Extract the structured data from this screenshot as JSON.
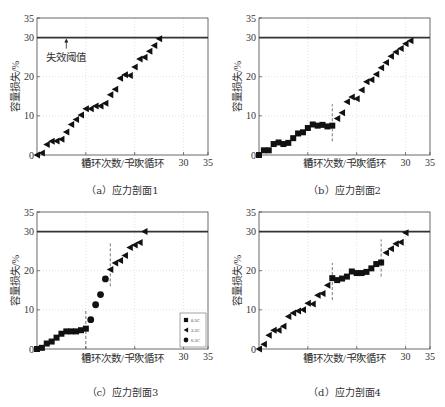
{
  "figure": {
    "panels": [
      {
        "id": "a",
        "caption": "（a）应力剖面1"
      },
      {
        "id": "b",
        "caption": "（b）应力剖面2"
      },
      {
        "id": "c",
        "caption": "（c）应力剖面3"
      },
      {
        "id": "d",
        "caption": "（d）应力剖面4"
      }
    ]
  },
  "chart_data": [
    {
      "type": "scatter",
      "title": "（a）应力剖面1",
      "xlabel": "循环次数/千次循环",
      "ylabel": "容量损失/%",
      "xlim": [
        0,
        35
      ],
      "ylim": [
        0,
        35
      ],
      "xticks": [
        10,
        20,
        30,
        35
      ],
      "yticks": [
        0,
        10,
        20,
        30,
        35
      ],
      "grid": true,
      "threshold": {
        "y": 30,
        "label": "失效阈值",
        "arrow_x": 6
      },
      "dividers": [],
      "series": [
        {
          "name": "3.5C",
          "marker": "triangle-left",
          "x": [
            0,
            1,
            2,
            3,
            4,
            5,
            6,
            7,
            8,
            9,
            10,
            11,
            12,
            13,
            14,
            15,
            16,
            17,
            18,
            19,
            20,
            21,
            22,
            23,
            24,
            25
          ],
          "y": [
            0,
            0.5,
            2.7,
            3.5,
            3.6,
            4.0,
            5.9,
            7.8,
            9.1,
            10.2,
            11.8,
            11.8,
            12.5,
            12.5,
            13.2,
            15.4,
            16.8,
            19.6,
            20.5,
            20.3,
            22.5,
            24.5,
            25.0,
            26.5,
            28.0,
            29.7
          ]
        }
      ]
    },
    {
      "type": "scatter",
      "title": "（b）应力剖面2",
      "xlabel": "循环次数/千次循环",
      "ylabel": "容量损失/%",
      "xlim": [
        0,
        35
      ],
      "ylim": [
        0,
        35
      ],
      "xticks": [
        10,
        20,
        30,
        35
      ],
      "yticks": [
        0,
        10,
        20,
        30,
        35
      ],
      "grid": true,
      "threshold": {
        "y": 30
      },
      "dividers": [
        {
          "x": 15,
          "y0": 3.5,
          "y1": 13
        }
      ],
      "series": [
        {
          "name": "0.5C",
          "marker": "square",
          "x": [
            0,
            1,
            2,
            3,
            4,
            5,
            6,
            7,
            8,
            9,
            10,
            11,
            12,
            13,
            14,
            15
          ],
          "y": [
            0,
            1.2,
            1.2,
            2.8,
            3.2,
            2.8,
            3.1,
            4.3,
            5.5,
            5.8,
            6.9,
            7.8,
            7.5,
            7.7,
            7.3,
            7.5
          ]
        },
        {
          "name": "3.5C",
          "marker": "triangle-left",
          "x": [
            16,
            17,
            18,
            19,
            20,
            21,
            22,
            23,
            24,
            25,
            26,
            27,
            28,
            29,
            30,
            31
          ],
          "y": [
            9.3,
            10.8,
            13.6,
            14.8,
            14.4,
            16.6,
            18.7,
            19.2,
            20.6,
            22.3,
            23.6,
            25.2,
            26.3,
            27.2,
            28.4,
            29.2
          ]
        }
      ]
    },
    {
      "type": "scatter",
      "title": "（c）应力剖面3",
      "xlabel": "循环次数/千次循环",
      "ylabel": "容量损失/%",
      "xlim": [
        0,
        35
      ],
      "ylim": [
        0,
        35
      ],
      "xticks": [
        10,
        20,
        30,
        35
      ],
      "yticks": [
        0,
        10,
        20,
        30,
        35
      ],
      "grid": true,
      "threshold": {
        "y": 30
      },
      "dividers": [
        {
          "x": 10,
          "y0": 0,
          "y1": 10
        },
        {
          "x": 15,
          "y0": 16,
          "y1": 27
        }
      ],
      "legend": {
        "position": "lower right",
        "entries": [
          "0.5C",
          "3.5C",
          "6.5C"
        ]
      },
      "series": [
        {
          "name": "0.5C",
          "marker": "square",
          "x": [
            0,
            1,
            2,
            3,
            4,
            5,
            6,
            7,
            8,
            9,
            10
          ],
          "y": [
            0,
            0.3,
            1.4,
            1.9,
            2.9,
            3.9,
            4.5,
            4.5,
            4.5,
            4.8,
            5.2
          ]
        },
        {
          "name": "6.5C",
          "marker": "circle",
          "x": [
            11,
            12,
            13,
            14
          ],
          "y": [
            7.5,
            11.3,
            13.9,
            17.9
          ]
        },
        {
          "name": "3.5C",
          "marker": "triangle-left",
          "x": [
            15,
            16,
            17,
            18,
            19,
            20,
            21,
            22
          ],
          "y": [
            20.3,
            22.0,
            22.6,
            23.9,
            25.9,
            26.6,
            27.2,
            30.0
          ]
        }
      ]
    },
    {
      "type": "scatter",
      "title": "（d）应力剖面4",
      "xlabel": "循环次数/千次循环",
      "ylabel": "容量损失/%",
      "xlim": [
        0,
        35
      ],
      "ylim": [
        0,
        35
      ],
      "xticks": [
        10,
        20,
        30,
        35
      ],
      "yticks": [
        0,
        10,
        20,
        30,
        35
      ],
      "grid": true,
      "threshold": {
        "y": 30
      },
      "dividers": [
        {
          "x": 15,
          "y0": 12.5,
          "y1": 22
        },
        {
          "x": 25,
          "y0": 18.5,
          "y1": 28
        }
      ],
      "series": [
        {
          "name": "3.5C",
          "marker": "triangle-left",
          "x": [
            0,
            1,
            2,
            3,
            4,
            5,
            6,
            7,
            8,
            9,
            10,
            11,
            12,
            13,
            14
          ],
          "y": [
            0,
            1.2,
            3.5,
            4.8,
            4.8,
            5.8,
            8.3,
            9.2,
            9.7,
            10.0,
            11.7,
            11.5,
            13.7,
            14.2,
            16.3
          ]
        },
        {
          "name": "0.5C",
          "marker": "square",
          "x": [
            15,
            16,
            17,
            18,
            19,
            20,
            21,
            22,
            23,
            24,
            25
          ],
          "y": [
            18.1,
            17.6,
            18.0,
            18.5,
            19.8,
            19.4,
            19.4,
            19.7,
            20.6,
            21.7,
            22.1
          ]
        },
        {
          "name": "3.5C-b",
          "marker": "triangle-left",
          "x": [
            26,
            27,
            28,
            29,
            30
          ],
          "y": [
            24.6,
            25.6,
            26.9,
            27.3,
            29.7
          ]
        }
      ]
    }
  ],
  "layout": {
    "panels": [
      {
        "left": 37,
        "top": 18,
        "width": 171,
        "height": 137,
        "captionY": 182,
        "xlabelY": 167
      },
      {
        "left": 259,
        "top": 18,
        "width": 171,
        "height": 137,
        "captionY": 182,
        "xlabelY": 167
      },
      {
        "left": 37,
        "top": 212,
        "width": 171,
        "height": 137,
        "captionY": 386,
        "xlabelY": 362
      },
      {
        "left": 259,
        "top": 212,
        "width": 171,
        "height": 137,
        "captionY": 386,
        "xlabelY": 362
      }
    ]
  }
}
